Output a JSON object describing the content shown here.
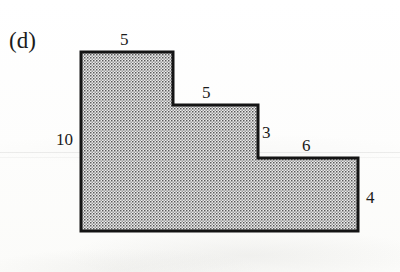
{
  "figure": {
    "part_label": "(d)",
    "shape_name": "stepped-polygon",
    "fill_pattern": "dotted-stipple",
    "outline_color": "#141414",
    "fill_color": "#e8e8e8",
    "dot_color": "#4a4a4a",
    "background_color": "#fdfdfc",
    "vertices": [
      [
        81,
        52
      ],
      [
        173,
        52
      ],
      [
        173,
        105
      ],
      [
        258,
        105
      ],
      [
        258,
        158
      ],
      [
        358,
        158
      ],
      [
        358,
        231
      ],
      [
        81,
        231
      ]
    ],
    "dimensions": [
      {
        "id": "top-left-width",
        "value": "5",
        "side": "top",
        "x": 126,
        "y": 31
      },
      {
        "id": "middle-width",
        "value": "5",
        "side": "top",
        "x": 208,
        "y": 84
      },
      {
        "id": "left-height",
        "value": "10",
        "side": "left",
        "x": 56,
        "y": 131
      },
      {
        "id": "middle-height",
        "value": "3",
        "side": "right",
        "x": 262,
        "y": 124
      },
      {
        "id": "lower-right-width",
        "value": "6",
        "side": "top",
        "x": 302,
        "y": 137
      },
      {
        "id": "right-height",
        "value": "4",
        "side": "right",
        "x": 366,
        "y": 189
      }
    ]
  }
}
